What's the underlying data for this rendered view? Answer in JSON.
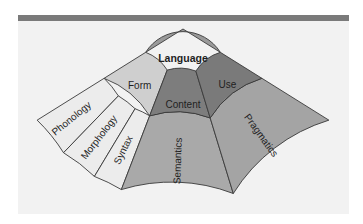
{
  "diagram": {
    "root": {
      "label": "Language",
      "color": "#9a9a9a"
    },
    "middle": [
      {
        "label": "Form",
        "color": "#cfcfcf"
      },
      {
        "label": "Content",
        "color": "#7d7d7d"
      },
      {
        "label": "Use",
        "color": "#7a7a7a"
      }
    ],
    "outer": [
      {
        "label": "Phonology",
        "parent": "Form",
        "color": "#ececec"
      },
      {
        "label": "Morphology",
        "parent": "Form",
        "color": "#ececec"
      },
      {
        "label": "Syntax",
        "parent": "Form",
        "color": "#ececec"
      },
      {
        "label": "Semantics",
        "parent": "Content",
        "color": "#a9a9a9"
      },
      {
        "label": "Pragmatics",
        "parent": "Use",
        "color": "#a4a4a4"
      }
    ]
  },
  "colors": {
    "header_bar": "#7a7a7a",
    "panel_bg": "#f2f2f2",
    "stroke": "#3a3a3a"
  }
}
